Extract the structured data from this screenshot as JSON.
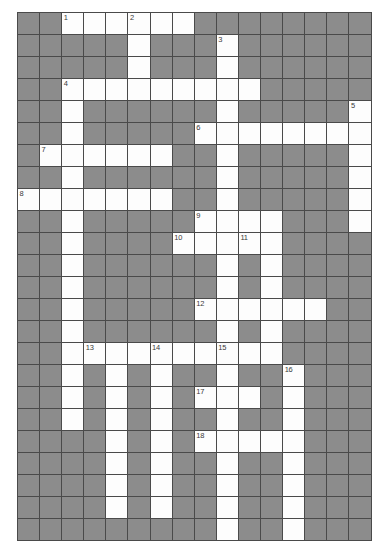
{
  "puzzle": {
    "title": "Crossword Puzzle Grid",
    "type": "crossword-grid",
    "columns": 16,
    "rows": 24,
    "colors": {
      "block": "#8c8c8c",
      "open": "#fdfdfd",
      "grid_line": "#4a4a4a",
      "number_text": "#3a3a3a",
      "page_background": "#ffffff"
    },
    "legend": {
      "open_cell": "white writable square",
      "block_cell": "shaded non-writable square"
    },
    "clue_numbers": [
      {
        "number": "1",
        "row": 0,
        "col": 2
      },
      {
        "number": "2",
        "row": 0,
        "col": 5
      },
      {
        "number": "3",
        "row": 1,
        "col": 9
      },
      {
        "number": "4",
        "row": 3,
        "col": 2
      },
      {
        "number": "5",
        "row": 4,
        "col": 15
      },
      {
        "number": "6",
        "row": 5,
        "col": 8
      },
      {
        "number": "7",
        "row": 6,
        "col": 1
      },
      {
        "number": "8",
        "row": 8,
        "col": 0
      },
      {
        "number": "9",
        "row": 9,
        "col": 8
      },
      {
        "number": "10",
        "row": 10,
        "col": 7
      },
      {
        "number": "11",
        "row": 10,
        "col": 10
      },
      {
        "number": "12",
        "row": 13,
        "col": 8
      },
      {
        "number": "13",
        "row": 15,
        "col": 3
      },
      {
        "number": "14",
        "row": 15,
        "col": 6
      },
      {
        "number": "15",
        "row": 15,
        "col": 9
      },
      {
        "number": "16",
        "row": 16,
        "col": 12
      },
      {
        "number": "17",
        "row": 17,
        "col": 8
      },
      {
        "number": "18",
        "row": 19,
        "col": 8
      }
    ],
    "open_cells": [
      {
        "row": 0,
        "cols": [
          2,
          3,
          4,
          5,
          6,
          7
        ]
      },
      {
        "row": 1,
        "cols": [
          5,
          9
        ]
      },
      {
        "row": 2,
        "cols": [
          5,
          9
        ]
      },
      {
        "row": 3,
        "cols": [
          2,
          3,
          4,
          5,
          6,
          7,
          8,
          9,
          10
        ]
      },
      {
        "row": 4,
        "cols": [
          2,
          9,
          15
        ]
      },
      {
        "row": 5,
        "cols": [
          2,
          8,
          9,
          10,
          11,
          12,
          13,
          14,
          15
        ]
      },
      {
        "row": 6,
        "cols": [
          1,
          2,
          3,
          4,
          5,
          6,
          9,
          15
        ]
      },
      {
        "row": 7,
        "cols": [
          2,
          9,
          15
        ]
      },
      {
        "row": 8,
        "cols": [
          0,
          1,
          2,
          3,
          4,
          5,
          6,
          9,
          15
        ]
      },
      {
        "row": 9,
        "cols": [
          2,
          8,
          9,
          10,
          11,
          15
        ]
      },
      {
        "row": 10,
        "cols": [
          2,
          7,
          8,
          9,
          10,
          11
        ]
      },
      {
        "row": 11,
        "cols": [
          2,
          9,
          11
        ]
      },
      {
        "row": 12,
        "cols": [
          2,
          9,
          11
        ]
      },
      {
        "row": 13,
        "cols": [
          2,
          8,
          9,
          10,
          11,
          12,
          13
        ]
      },
      {
        "row": 14,
        "cols": [
          2,
          9,
          11
        ]
      },
      {
        "row": 15,
        "cols": [
          2,
          3,
          4,
          5,
          6,
          7,
          8,
          9,
          10,
          11
        ]
      },
      {
        "row": 16,
        "cols": [
          2,
          4,
          6,
          9,
          12
        ]
      },
      {
        "row": 17,
        "cols": [
          2,
          4,
          6,
          8,
          9,
          10,
          12
        ]
      },
      {
        "row": 18,
        "cols": [
          2,
          4,
          6,
          9,
          12
        ]
      },
      {
        "row": 19,
        "cols": [
          4,
          6,
          8,
          9,
          10,
          11,
          12
        ]
      },
      {
        "row": 20,
        "cols": [
          4,
          6,
          9,
          12
        ]
      },
      {
        "row": 21,
        "cols": [
          4,
          6,
          9,
          12
        ]
      },
      {
        "row": 22,
        "cols": [
          4,
          6,
          9,
          12
        ]
      },
      {
        "row": 23,
        "cols": [
          9,
          12
        ]
      }
    ]
  }
}
